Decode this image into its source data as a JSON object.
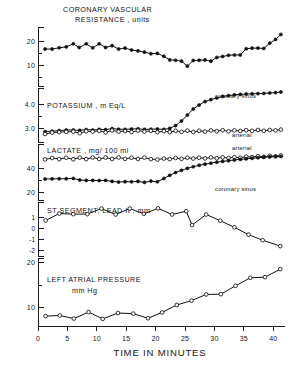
{
  "figure": {
    "xlabel": "TIME IN MINUTES",
    "x_ticks": [
      0,
      5,
      10,
      15,
      20,
      25,
      30,
      35,
      40
    ],
    "x_range": [
      0,
      42
    ]
  },
  "panels": {
    "crv": {
      "title_line1": "CORONARY VASCULAR",
      "title_line2": "RESISTANCE , units",
      "y_ticks": [
        "20",
        "10"
      ]
    },
    "potassium": {
      "title": "POTASSIUM , m Eq/L",
      "y_ticks": [
        "4.0",
        "3.0"
      ],
      "label_cs": "coronary sinus",
      "label_art": "arterial"
    },
    "lactate": {
      "title": "LACTATE , mg/ 100 ml",
      "y_ticks": [
        "40",
        "20"
      ],
      "label_art": "arterial",
      "label_cs": "coronary sinus"
    },
    "st": {
      "title": "ST  SEGMENT, LEAD II , mm",
      "y_ticks": [
        "1",
        "0",
        "-1",
        "-2"
      ]
    },
    "lap": {
      "title_line1": "LEFT ATRIAL PRESSURE",
      "title_line2": "mm Hg",
      "y_ticks": [
        "20",
        "10"
      ]
    }
  },
  "chart_data": {
    "type": "line",
    "xlabel": "TIME IN MINUTES",
    "xlim": [
      0,
      42
    ],
    "grid": false,
    "legend": "inline annotations",
    "panels": [
      {
        "name": "coronary_vascular_resistance",
        "ylabel": "CORONARY VASCULAR RESISTANCE , units",
        "ylim": [
          8,
          27
        ],
        "yticks": [
          10,
          20
        ],
        "series": [
          {
            "name": "coronary vascular resistance",
            "marker": "filled-circle",
            "x": [
              1.2,
              2.4,
              3.6,
              4.8,
              6.0,
              7.0,
              8.2,
              9.3,
              10.4,
              11.5,
              12.6,
              13.7,
              14.8,
              15.9,
              17.0,
              18.1,
              19.2,
              20.3,
              21.4,
              22.4,
              23.4,
              24.4,
              25.4,
              26.4,
              27.4,
              28.4,
              29.4,
              30.4,
              31.4,
              32.4,
              33.4,
              34.4,
              35.4,
              36.4,
              37.4,
              38.4,
              39.4,
              40.4,
              41.3
            ],
            "y": [
              19.9,
              19.9,
              20.3,
              20.6,
              21.6,
              20.4,
              21.6,
              20.3,
              21.6,
              20.4,
              21.0,
              19.9,
              20.2,
              19.6,
              19.3,
              18.9,
              18.4,
              18.5,
              17.6,
              16.4,
              16.3,
              16.0,
              14.4,
              16.2,
              16.3,
              16.4,
              16.0,
              17.2,
              17.5,
              17.9,
              18.0,
              18.0,
              20.0,
              20.2,
              20.2,
              20.1,
              21.8,
              23.0,
              24.6
            ]
          }
        ]
      },
      {
        "name": "potassium",
        "ylabel": "POTASSIUM , m Eq/L",
        "ylim": [
          2.9,
          5.6
        ],
        "yticks": [
          3.0,
          4.0
        ],
        "series": [
          {
            "name": "coronary sinus",
            "marker": "filled-circle",
            "x": [
              1.2,
              2.4,
              3.6,
              4.8,
              6.0,
              7.1,
              8.2,
              9.3,
              10.4,
              11.5,
              12.6,
              13.7,
              14.8,
              15.9,
              17.0,
              18.1,
              19.2,
              20.3,
              21.4,
              22.4,
              23.4,
              24.4,
              25.4,
              26.4,
              27.4,
              28.4,
              29.4,
              30.4,
              31.4,
              32.4,
              33.4,
              34.4,
              35.4,
              36.4,
              37.4,
              38.4,
              39.4,
              40.4,
              41.3
            ],
            "y": [
              3.42,
              3.44,
              3.47,
              3.5,
              3.5,
              3.48,
              3.52,
              3.5,
              3.53,
              3.52,
              3.57,
              3.54,
              3.53,
              3.55,
              3.56,
              3.53,
              3.54,
              3.55,
              3.53,
              3.58,
              3.72,
              3.95,
              4.25,
              4.55,
              4.75,
              4.92,
              5.02,
              5.1,
              5.18,
              5.22,
              5.26,
              5.28,
              5.3,
              5.31,
              5.32,
              5.33,
              5.35,
              5.37,
              5.4
            ]
          },
          {
            "name": "arterial",
            "marker": "open-circle",
            "x": [
              1.2,
              2.4,
              3.6,
              4.8,
              6.0,
              7.1,
              8.2,
              9.3,
              10.4,
              11.5,
              12.6,
              13.7,
              14.8,
              15.9,
              17.0,
              18.1,
              19.2,
              20.3,
              21.4,
              22.4,
              23.4,
              24.4,
              25.4,
              26.4,
              27.4,
              28.4,
              29.4,
              30.4,
              31.4,
              32.4,
              33.4,
              34.4,
              35.4,
              36.4,
              37.4,
              38.4,
              39.4,
              40.4,
              41.3
            ],
            "y": [
              3.3,
              3.37,
              3.39,
              3.41,
              3.42,
              3.34,
              3.44,
              3.42,
              3.46,
              3.38,
              3.48,
              3.42,
              3.45,
              3.4,
              3.47,
              3.42,
              3.46,
              3.39,
              3.44,
              3.4,
              3.46,
              3.41,
              3.47,
              3.4,
              3.46,
              3.42,
              3.48,
              3.44,
              3.49,
              3.43,
              3.48,
              3.45,
              3.49,
              3.46,
              3.5,
              3.46,
              3.5,
              3.48,
              3.52
            ]
          }
        ]
      },
      {
        "name": "lactate",
        "ylabel": "LACTATE , mg/ 100 ml",
        "ylim": [
          15,
          55
        ],
        "yticks": [
          20,
          40
        ],
        "series": [
          {
            "name": "arterial",
            "marker": "open-circle",
            "x": [
              1.2,
              2.4,
              3.6,
              4.8,
              6.0,
              7.1,
              8.2,
              9.3,
              10.4,
              11.5,
              12.6,
              13.7,
              14.8,
              15.9,
              17.0,
              18.1,
              19.2,
              20.3,
              21.4,
              22.4,
              23.4,
              24.4,
              25.4,
              26.4,
              27.4,
              28.4,
              29.4,
              30.4,
              31.4,
              32.4,
              33.4,
              34.4,
              35.4,
              36.4,
              37.4,
              38.4,
              39.4,
              40.4,
              41.3
            ],
            "y": [
              44.0,
              45.0,
              44.2,
              45.2,
              44.1,
              45.3,
              44.2,
              45.4,
              44.3,
              45.3,
              44.3,
              45.4,
              44.4,
              45.2,
              44.3,
              45.3,
              44.2,
              43.9,
              44.6,
              44.2,
              45.0,
              44.4,
              45.2,
              44.6,
              45.2,
              44.7,
              45.4,
              44.8,
              45.5,
              45.0,
              45.6,
              45.2,
              46.0,
              45.6,
              46.3,
              45.8,
              46.6,
              46.2,
              46.8
            ]
          },
          {
            "name": "coronary sinus",
            "marker": "filled-circle",
            "x": [
              1.2,
              2.4,
              3.6,
              4.8,
              6.0,
              7.1,
              8.2,
              9.3,
              10.4,
              11.5,
              12.6,
              13.7,
              14.8,
              15.9,
              17.0,
              18.1,
              19.2,
              20.3,
              21.4,
              22.4,
              23.4,
              24.4,
              25.4,
              26.4,
              27.4,
              28.4,
              29.4,
              30.4,
              31.4,
              32.4,
              33.4,
              34.4,
              35.4,
              36.4,
              37.4,
              38.4,
              39.4,
              40.4,
              41.3
            ],
            "y": [
              30.0,
              30.1,
              30.2,
              30.2,
              30.4,
              29.3,
              29.0,
              29.0,
              28.9,
              29.0,
              28.3,
              27.8,
              28.1,
              28.0,
              28.3,
              27.6,
              28.5,
              28.0,
              30.4,
              32.6,
              34.6,
              36.2,
              37.6,
              38.8,
              39.8,
              40.6,
              41.3,
              42.0,
              42.6,
              43.1,
              43.6,
              44.0,
              44.4,
              44.8,
              45.2,
              45.6,
              45.8,
              46.0,
              46.1
            ]
          }
        ]
      },
      {
        "name": "st_segment_lead_II",
        "ylabel": "ST  SEGMENT, LEAD II , mm",
        "ylim": [
          -2.6,
          1.5
        ],
        "yticks": [
          -2,
          -1,
          0,
          1
        ],
        "series": [
          {
            "name": "ST segment",
            "marker": "open-circle",
            "x": [
              1.3,
              3.6,
              6.0,
              8.4,
              10.8,
              13.2,
              15.6,
              18.0,
              20.4,
              22.8,
              25.2,
              26.2,
              28.6,
              31.0,
              33.4,
              35.8,
              38.2,
              41.2
            ],
            "y": [
              0.1,
              0.62,
              0.58,
              0.58,
              1.0,
              0.55,
              1.0,
              0.6,
              1.02,
              0.55,
              0.8,
              -0.25,
              0.55,
              0.08,
              -0.42,
              -0.98,
              -1.4,
              -1.85
            ]
          }
        ]
      },
      {
        "name": "left_atrial_pressure",
        "ylabel": "LEFT ATRIAL PRESSURE mm Hg",
        "ylim": [
          5,
          27
        ],
        "yticks": [
          10,
          20
        ],
        "series": [
          {
            "name": "left atrial pressure",
            "marker": "open-circle",
            "x": [
              1.3,
              3.7,
              6.1,
              8.6,
              11.0,
              13.6,
              16.2,
              18.7,
              21.1,
              23.6,
              26.1,
              28.6,
              31.1,
              33.6,
              36.1,
              38.6,
              41.2
            ],
            "y": [
              8.2,
              8.4,
              7.4,
              9.5,
              7.3,
              9.2,
              9.0,
              7.5,
              9.4,
              11.8,
              13.2,
              15.2,
              15.3,
              18.0,
              20.6,
              20.8,
              23.4
            ]
          }
        ]
      }
    ]
  }
}
